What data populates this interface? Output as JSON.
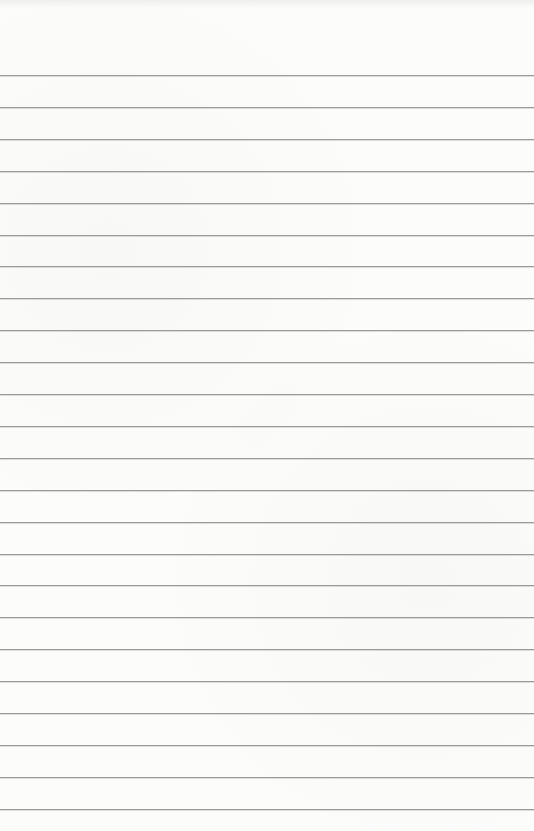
{
  "paper": {
    "type": "lined-notepad",
    "background_color": "#fcfcfb",
    "rule_color": "#9a9a98",
    "first_rule_y": 75,
    "rule_spacing": 31.9,
    "rule_count": 24
  }
}
